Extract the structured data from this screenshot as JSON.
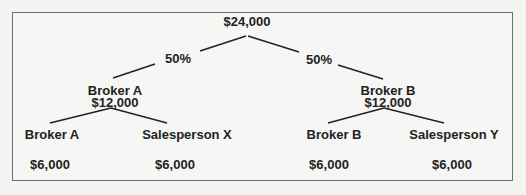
{
  "diagram": {
    "root": {
      "amount": "$24,000"
    },
    "split_left": "50%",
    "split_right": "50%",
    "left_branch": {
      "name": "Broker A",
      "amount": "$12,000",
      "children": [
        {
          "name": "Broker A",
          "amount": "$6,000"
        },
        {
          "name": "Salesperson X",
          "amount": "$6,000"
        }
      ]
    },
    "right_branch": {
      "name": "Broker B",
      "amount": "$12,000",
      "children": [
        {
          "name": "Broker B",
          "amount": "$6,000"
        },
        {
          "name": "Salesperson Y",
          "amount": "$6,000"
        }
      ]
    },
    "colors": {
      "text": "#222222",
      "line": "#222222",
      "border": "#6e6e6e",
      "background": "#f6f6f4"
    }
  }
}
